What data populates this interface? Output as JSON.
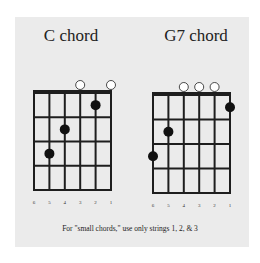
{
  "colors": {
    "background": "#ffffff",
    "panel": "#ebebeb",
    "grid": "#1e1e1e",
    "finger_dot": "#111111",
    "open_string": "#ffffff"
  },
  "chords": [
    {
      "name": "C chord",
      "strings_label": [
        "6",
        "5",
        "4",
        "3",
        "2",
        "1"
      ],
      "open_strings": [
        3,
        1
      ],
      "fingers": [
        {
          "string": 2,
          "fret": 1
        },
        {
          "string": 4,
          "fret": 2
        },
        {
          "string": 5,
          "fret": 3
        }
      ]
    },
    {
      "name": "G7 chord",
      "strings_label": [
        "6",
        "5",
        "4",
        "3",
        "2",
        "1"
      ],
      "open_strings": [
        4,
        3,
        2
      ],
      "fingers": [
        {
          "string": 1,
          "fret": 1
        },
        {
          "string": 5,
          "fret": 2
        },
        {
          "string": 6,
          "fret": 3
        }
      ]
    }
  ],
  "footnote": "For \"small chords,\" use only strings 1, 2, & 3"
}
